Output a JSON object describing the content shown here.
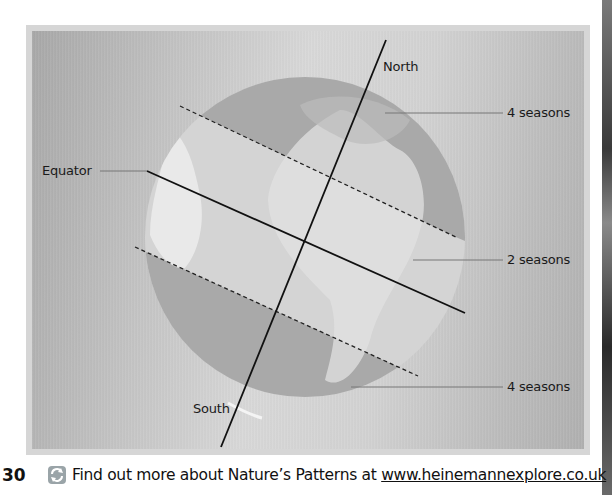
{
  "diagram": {
    "labels": {
      "north": "North",
      "south": "South",
      "equator": "Equator",
      "north_zone": "4 seasons",
      "middle_zone": "2 seasons",
      "south_zone": "4 seasons"
    }
  },
  "footer": {
    "page_number": "30",
    "icon": "explore-refresh-icon",
    "text_prefix": "Find out more about Nature’s Patterns at ",
    "link_text": "www.heinemannexplore.co.uk"
  },
  "colors": {
    "zone_temperate": "#a9a9a9",
    "zone_tropical": "#d9d9d9",
    "land_highlight": "#ececec",
    "lines": "#111111"
  }
}
